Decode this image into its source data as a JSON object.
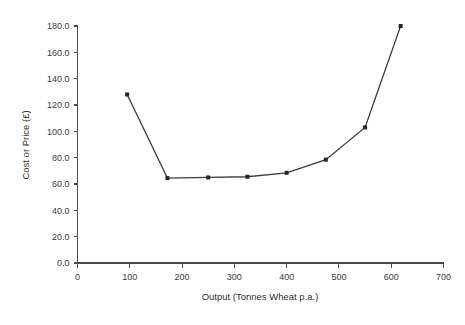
{
  "chart_data": {
    "type": "line",
    "title": "",
    "xlabel": "Output   (Tonnes Wheat p.a.)",
    "ylabel": "Cost or Price (£)",
    "xlim": [
      0,
      700
    ],
    "ylim": [
      0.0,
      180.0
    ],
    "grid": false,
    "legend": "none",
    "x_ticks": [
      "0",
      "100",
      "200",
      "300",
      "400",
      "500",
      "600",
      "700"
    ],
    "x_tick_values": [
      0,
      100,
      200,
      300,
      400,
      500,
      600,
      700
    ],
    "y_ticks": [
      "0.0",
      "20.0",
      "40.0",
      "60.0",
      "80.0",
      "100.0",
      "120.0",
      "140.0",
      "160.0",
      "180.0"
    ],
    "y_tick_values": [
      0.0,
      20.0,
      40.0,
      60.0,
      80.0,
      100.0,
      120.0,
      140.0,
      160.0,
      180.0
    ],
    "series": [
      {
        "name": "Cost or Price",
        "marker": "square",
        "color": "#3c3c3c",
        "x": [
          95,
          172,
          250,
          325,
          400,
          475,
          550,
          618
        ],
        "values": [
          128.0,
          64.5,
          65.0,
          65.5,
          68.5,
          78.5,
          103.0,
          180.0
        ]
      }
    ]
  }
}
